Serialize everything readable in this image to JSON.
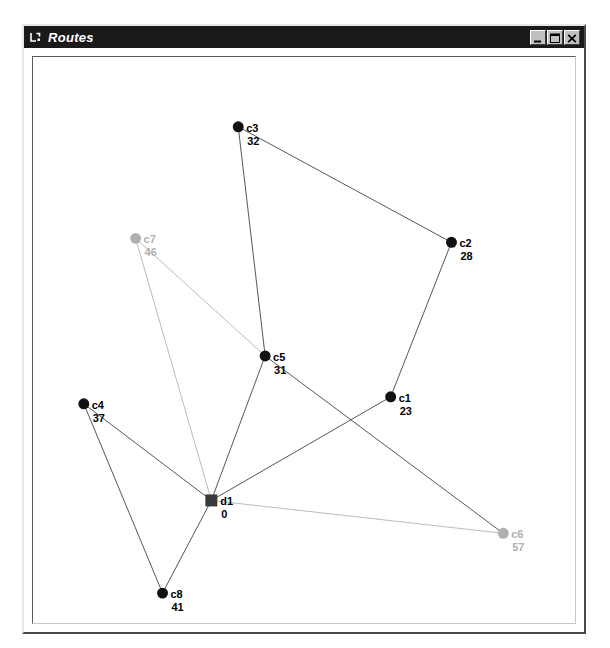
{
  "window": {
    "title": "Routes",
    "icon": "window-app-icon",
    "controls": [
      {
        "name": "minimize-button",
        "glyph": "minimize-icon",
        "label": "_"
      },
      {
        "name": "maximize-button",
        "glyph": "maximize-icon",
        "label": "□"
      },
      {
        "name": "close-button",
        "glyph": "close-icon",
        "label": "×"
      }
    ]
  },
  "colors": {
    "titlebar_bg": "#1a1a1a",
    "titlebar_fg": "#ffffff",
    "window_face": "#c0c0c0",
    "canvas_bg": "#ffffff",
    "node_active": "#111111",
    "node_inactive": "#b0b0b0",
    "edge_active": "#555555",
    "edge_inactive": "#bbbbbb",
    "depot_fill": "#3a3a3a",
    "label_active": "#000000",
    "label_inactive": "#b0b0b0"
  },
  "graph": {
    "canvas": {
      "width": 544,
      "height": 568
    },
    "nodes": [
      {
        "id": "d1",
        "label": "d1",
        "value": "0",
        "x": 179,
        "y": 445,
        "shape": "square",
        "state": "depot",
        "r": 6,
        "label_dx": 9,
        "label_dy": 2,
        "value_dx": 10,
        "value_dy": 15
      },
      {
        "id": "c1",
        "label": "c1",
        "value": "23",
        "x": 359,
        "y": 341,
        "shape": "circle",
        "state": "active",
        "r": 5.5,
        "label_dx": 8,
        "label_dy": 2,
        "value_dx": 9,
        "value_dy": 15
      },
      {
        "id": "c2",
        "label": "c2",
        "value": "28",
        "x": 420,
        "y": 186,
        "shape": "circle",
        "state": "active",
        "r": 5.5,
        "label_dx": 8,
        "label_dy": 2,
        "value_dx": 9,
        "value_dy": 15
      },
      {
        "id": "c3",
        "label": "c3",
        "value": "32",
        "x": 206,
        "y": 70,
        "shape": "circle",
        "state": "active",
        "r": 5.5,
        "label_dx": 8,
        "label_dy": 2,
        "value_dx": 9,
        "value_dy": 15
      },
      {
        "id": "c4",
        "label": "c4",
        "value": "37",
        "x": 51,
        "y": 348,
        "shape": "circle",
        "state": "active",
        "r": 5.5,
        "label_dx": 8,
        "label_dy": 2,
        "value_dx": 9,
        "value_dy": 15
      },
      {
        "id": "c5",
        "label": "c5",
        "value": "31",
        "x": 233,
        "y": 300,
        "shape": "circle",
        "state": "active",
        "r": 5.5,
        "label_dx": 8,
        "label_dy": 2,
        "value_dx": 9,
        "value_dy": 15
      },
      {
        "id": "c6",
        "label": "c6",
        "value": "57",
        "x": 472,
        "y": 478,
        "shape": "circle",
        "state": "inactive",
        "r": 5.5,
        "label_dx": 8,
        "label_dy": 2,
        "value_dx": 9,
        "value_dy": 15
      },
      {
        "id": "c7",
        "label": "c7",
        "value": "46",
        "x": 103,
        "y": 182,
        "shape": "circle",
        "state": "inactive",
        "r": 5.5,
        "label_dx": 8,
        "label_dy": 2,
        "value_dx": 9,
        "value_dy": 15
      },
      {
        "id": "c8",
        "label": "c8",
        "value": "41",
        "x": 130,
        "y": 538,
        "shape": "circle",
        "state": "active",
        "r": 5.5,
        "label_dx": 8,
        "label_dy": 2,
        "value_dx": 9,
        "value_dy": 15
      }
    ],
    "edges": [
      {
        "from": "c3",
        "to": "c5",
        "state": "active"
      },
      {
        "from": "c3",
        "to": "c2",
        "state": "active"
      },
      {
        "from": "c2",
        "to": "c1",
        "state": "active"
      },
      {
        "from": "c1",
        "to": "d1",
        "state": "active"
      },
      {
        "from": "c5",
        "to": "d1",
        "state": "active"
      },
      {
        "from": "c5",
        "to": "c6",
        "state": "active"
      },
      {
        "from": "c7",
        "to": "c5",
        "state": "inactive"
      },
      {
        "from": "c7",
        "to": "d1",
        "state": "inactive"
      },
      {
        "from": "d1",
        "to": "c6",
        "state": "inactive"
      },
      {
        "from": "c4",
        "to": "d1",
        "state": "active"
      },
      {
        "from": "c4",
        "to": "c8",
        "state": "active"
      },
      {
        "from": "c8",
        "to": "d1",
        "state": "active"
      }
    ]
  }
}
